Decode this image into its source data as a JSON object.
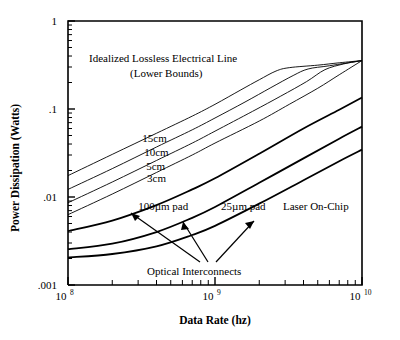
{
  "figure": {
    "background": "#ffffff",
    "ink": "#000000"
  },
  "axes": {
    "x": {
      "label": "Data Rate (hz)",
      "type": "log",
      "min": 100000000.0,
      "max": 10000000000.0,
      "tick_labels": [
        {
          "mantissa": "10",
          "exponent": "8",
          "value": 100000000
        },
        {
          "mantissa": "10",
          "exponent": "9",
          "value": 1000000000
        },
        {
          "mantissa": "10",
          "exponent": "10",
          "value": 10000000000
        }
      ]
    },
    "y": {
      "label": "Power Dissipation (Watts)",
      "type": "log",
      "min": 0.001,
      "max": 1,
      "tick_labels": [
        {
          "text": "1",
          "value": 1
        },
        {
          "text": ".1",
          "value": 0.1
        },
        {
          "text": ".01",
          "value": 0.01
        },
        {
          "text": ".001",
          "value": 0.001
        }
      ]
    }
  },
  "annotations": {
    "electrical_title_line1": "Idealized Lossless Electrical Line",
    "electrical_title_line2": "(Lower Bounds)",
    "optical_group_label": "Optical Interconnects"
  },
  "chart_data": {
    "type": "line",
    "title": "",
    "xlabel": "Data Rate (hz)",
    "ylabel": "Power Dissipation (Watts)",
    "xscale": "log",
    "yscale": "log",
    "xlim": [
      100000000,
      10000000000
    ],
    "ylim": [
      0.001,
      1
    ],
    "grid": false,
    "legend": "inline-labels",
    "notes": [
      "Idealized Lossless Electrical Line (Lower Bounds)",
      "Optical Interconnects"
    ],
    "series": [
      {
        "name": "15cm",
        "group": "electrical",
        "style": "thin",
        "label": "15cm",
        "label_x": 320000000,
        "label_y": 0.042,
        "points": [
          {
            "x": 100000000,
            "y": 0.0175
          },
          {
            "x": 200000000,
            "y": 0.0305
          },
          {
            "x": 400000000,
            "y": 0.053
          },
          {
            "x": 700000000,
            "y": 0.083
          },
          {
            "x": 1000000000,
            "y": 0.113
          },
          {
            "x": 1500000000,
            "y": 0.165
          },
          {
            "x": 2000000000,
            "y": 0.215
          },
          {
            "x": 2600000000,
            "y": 0.27
          },
          {
            "x": 3200000000,
            "y": 0.295
          },
          {
            "x": 5000000000,
            "y": 0.315
          },
          {
            "x": 7000000000,
            "y": 0.335
          },
          {
            "x": 10000000000,
            "y": 0.355
          }
        ]
      },
      {
        "name": "10cm",
        "group": "electrical",
        "style": "thin",
        "label": "10cm",
        "label_x": 330000000,
        "label_y": 0.029,
        "points": [
          {
            "x": 100000000,
            "y": 0.0122
          },
          {
            "x": 200000000,
            "y": 0.021
          },
          {
            "x": 400000000,
            "y": 0.037
          },
          {
            "x": 700000000,
            "y": 0.058
          },
          {
            "x": 1000000000,
            "y": 0.079
          },
          {
            "x": 1600000000,
            "y": 0.12
          },
          {
            "x": 2400000000,
            "y": 0.175
          },
          {
            "x": 3400000000,
            "y": 0.24
          },
          {
            "x": 4300000000,
            "y": 0.285
          },
          {
            "x": 6000000000,
            "y": 0.31
          },
          {
            "x": 10000000000,
            "y": 0.355
          }
        ]
      },
      {
        "name": "5cm",
        "group": "electrical",
        "style": "thin",
        "label": "5cm",
        "label_x": 340000000,
        "label_y": 0.0205,
        "points": [
          {
            "x": 100000000,
            "y": 0.0086
          },
          {
            "x": 200000000,
            "y": 0.0148
          },
          {
            "x": 400000000,
            "y": 0.026
          },
          {
            "x": 700000000,
            "y": 0.041
          },
          {
            "x": 1000000000,
            "y": 0.056
          },
          {
            "x": 1800000000,
            "y": 0.094
          },
          {
            "x": 2800000000,
            "y": 0.14
          },
          {
            "x": 4200000000,
            "y": 0.205
          },
          {
            "x": 5600000000,
            "y": 0.28
          },
          {
            "x": 7500000000,
            "y": 0.325
          },
          {
            "x": 10000000000,
            "y": 0.355
          }
        ]
      },
      {
        "name": "3cm",
        "group": "electrical",
        "style": "thin",
        "label": "3cm",
        "label_x": 345000000,
        "label_y": 0.0148,
        "points": [
          {
            "x": 100000000,
            "y": 0.0063
          },
          {
            "x": 200000000,
            "y": 0.0108
          },
          {
            "x": 400000000,
            "y": 0.019
          },
          {
            "x": 700000000,
            "y": 0.03
          },
          {
            "x": 1000000000,
            "y": 0.041
          },
          {
            "x": 2000000000,
            "y": 0.073
          },
          {
            "x": 3200000000,
            "y": 0.113
          },
          {
            "x": 5000000000,
            "y": 0.172
          },
          {
            "x": 7000000000,
            "y": 0.245
          },
          {
            "x": 10000000000,
            "y": 0.355
          }
        ]
      },
      {
        "name": "100um pad",
        "group": "optical",
        "style": "thick",
        "label": "100µm pad",
        "label_x": 300000000,
        "label_y": 0.0072,
        "points": [
          {
            "x": 100000000,
            "y": 0.0041
          },
          {
            "x": 200000000,
            "y": 0.0054
          },
          {
            "x": 400000000,
            "y": 0.0081
          },
          {
            "x": 700000000,
            "y": 0.0122
          },
          {
            "x": 1000000000,
            "y": 0.0163
          },
          {
            "x": 2000000000,
            "y": 0.031
          },
          {
            "x": 4000000000,
            "y": 0.06
          },
          {
            "x": 7000000000,
            "y": 0.098
          },
          {
            "x": 10000000000,
            "y": 0.135
          }
        ]
      },
      {
        "name": "25um pad",
        "group": "optical",
        "style": "thick",
        "label": "25µm pad",
        "label_x": 1100000000,
        "label_y": 0.0072,
        "points": [
          {
            "x": 100000000,
            "y": 0.00255
          },
          {
            "x": 200000000,
            "y": 0.00295
          },
          {
            "x": 400000000,
            "y": 0.004
          },
          {
            "x": 700000000,
            "y": 0.0058
          },
          {
            "x": 1000000000,
            "y": 0.0077
          },
          {
            "x": 2000000000,
            "y": 0.0145
          },
          {
            "x": 4000000000,
            "y": 0.0275
          },
          {
            "x": 7000000000,
            "y": 0.046
          },
          {
            "x": 10000000000,
            "y": 0.063
          }
        ]
      },
      {
        "name": "Laser On-Chip",
        "group": "optical",
        "style": "thick",
        "label": "Laser On-Chip",
        "label_x": 2900000000,
        "label_y": 0.0072,
        "points": [
          {
            "x": 100000000,
            "y": 0.00205
          },
          {
            "x": 200000000,
            "y": 0.00225
          },
          {
            "x": 400000000,
            "y": 0.00275
          },
          {
            "x": 700000000,
            "y": 0.0037
          },
          {
            "x": 1000000000,
            "y": 0.0047
          },
          {
            "x": 2000000000,
            "y": 0.0084
          },
          {
            "x": 4000000000,
            "y": 0.0155
          },
          {
            "x": 7000000000,
            "y": 0.0255
          },
          {
            "x": 10000000000,
            "y": 0.0345
          }
        ]
      }
    ]
  }
}
